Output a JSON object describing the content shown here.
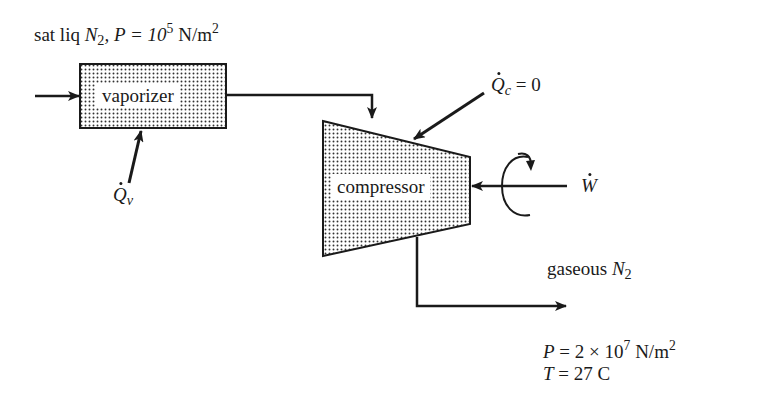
{
  "diagram": {
    "inlet": {
      "prefix": "sat liq ",
      "species": "N",
      "species_sub": "2",
      "pressure_label": ", P = 10",
      "pressure_exp": "5",
      "pressure_unit": " N/m",
      "unit_exp": "2"
    },
    "vaporizer": {
      "label": "vaporizer"
    },
    "vaporizer_heat": {
      "symbol": "Q",
      "sub": "v"
    },
    "compressor": {
      "label": "compressor"
    },
    "compressor_heat": {
      "symbol": "Q",
      "sub": "c",
      "value": " = 0"
    },
    "work": {
      "symbol": "W"
    },
    "outlet": {
      "prefix": "gaseous ",
      "species": "N",
      "species_sub": "2",
      "pressure_label": "P",
      "pressure_value": " = 2 × 10",
      "pressure_exp": "7",
      "pressure_unit": " N/m",
      "unit_exp": "2",
      "temperature_label": "T",
      "temperature_value": " = 27 C"
    },
    "colors": {
      "line": "#1a1a1a",
      "fill_dots": "#333333",
      "background": "#ffffff"
    }
  }
}
